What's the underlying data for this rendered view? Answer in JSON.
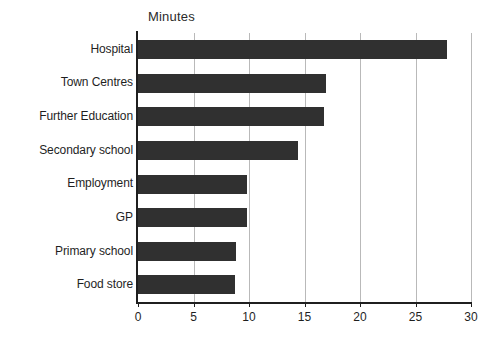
{
  "chart_data": {
    "type": "bar",
    "orientation": "horizontal",
    "title": "Minutes",
    "xlabel": "",
    "ylabel": "",
    "xlim": [
      0,
      30
    ],
    "xticks": [
      0,
      5,
      10,
      15,
      20,
      25,
      30
    ],
    "grid": true,
    "legend": false,
    "bar_color": "#303030",
    "categories": [
      "Hospital",
      "Town Centres",
      "Further Education",
      "Secondary school",
      "Employment",
      "GP",
      "Primary school",
      "Food store"
    ],
    "values": [
      27.8,
      16.9,
      16.8,
      14.4,
      9.8,
      9.8,
      8.8,
      8.7
    ]
  }
}
